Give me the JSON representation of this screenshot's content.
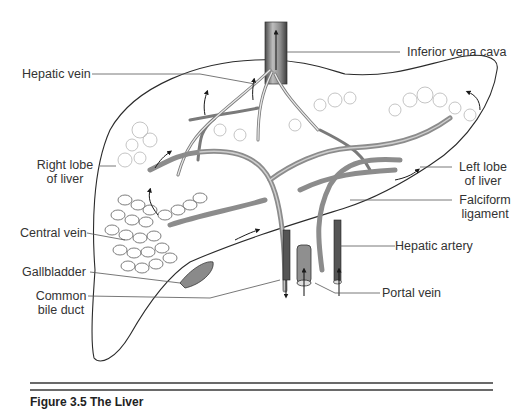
{
  "figure": {
    "subject": "The liver",
    "labels": {
      "inferior_vena_cava": "Inferior vena cava",
      "hepatic_vein": "Hepatic vein",
      "right_lobe_line1": "Right lobe",
      "right_lobe_line2": "of liver",
      "left_lobe_line1": "Left lobe",
      "left_lobe_line2": "of liver",
      "falciform_line1": "Falciform",
      "falciform_line2": "ligament",
      "central_vein": "Central vein",
      "hepatic_artery": "Hepatic artery",
      "gallbladder": "Gallbladder",
      "common_bile_line1": "Common",
      "common_bile_line2": "bile duct",
      "portal_vein": "Portal vein"
    },
    "caption": "Figure 3.5  The Liver"
  },
  "colors": {
    "outline": "#2b2b2b",
    "vessel_fill": "#9a9a9a",
    "vessel_dark": "#5a5a5a",
    "lobule": "#b5b5b5",
    "leader": "#555555",
    "rule": "#6a6a6a"
  }
}
